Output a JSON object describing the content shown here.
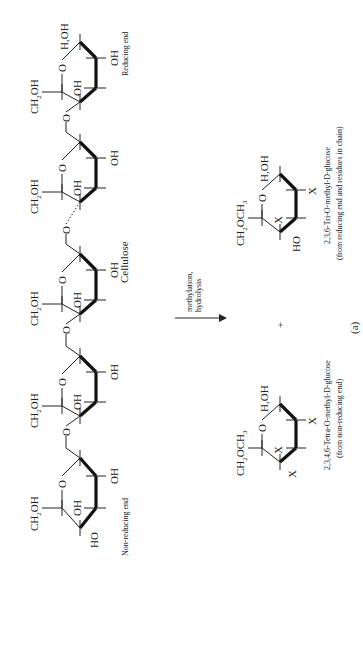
{
  "figure": {
    "panel_label": "(a)",
    "orientation": "rotated 90 degrees counter-clockwise"
  },
  "cellulose_chain": {
    "name": "Cellulose",
    "left_end_label": "Non-reducing end",
    "right_end_label": "Reducing end",
    "units": [
      {
        "c6": "CH2OH",
        "c3_oh": "OH",
        "c2_oh": "OH",
        "c4_sub": "HO",
        "anomeric": ""
      },
      {
        "c6": "CH2OH",
        "c3_oh": "OH",
        "c2_oh": "OH",
        "c4_sub": "",
        "anomeric": ""
      },
      {
        "c6": "CH2OH",
        "c3_oh": "OH",
        "c2_oh": "OH",
        "c4_sub": "",
        "anomeric": ""
      },
      {
        "c6": "CH2OH",
        "c3_oh": "OH",
        "c2_oh": "OH",
        "c4_sub": "",
        "anomeric": ""
      },
      {
        "c6": "CH2OH",
        "c3_oh": "OH",
        "c2_oh": "OH",
        "c4_sub": "",
        "anomeric": "H,OH"
      }
    ],
    "ring_oxygen": "O",
    "glycosidic_oxygen": "O"
  },
  "reaction": {
    "arrow_label_line1": "methylation,",
    "arrow_label_line2": "hydrolysis",
    "plus": "+"
  },
  "products": [
    {
      "c6": "CH2OCH3",
      "anomeric": "H,OH",
      "substituents": [
        "X",
        "X",
        "X"
      ],
      "ring_oxygen": "O",
      "name": "2,3,4,6-Tetra-O-methyl-D-glucose",
      "source": "(from non-reducing end)"
    },
    {
      "c6": "CH2OCH3",
      "anomeric": "H,OH",
      "substituents": [
        "X",
        "X",
        "HO"
      ],
      "ring_oxygen": "O",
      "name": "2,3,6-Tri-O-methyl-D-glucose",
      "source": "(from reducing end and residues in chain)"
    }
  ]
}
